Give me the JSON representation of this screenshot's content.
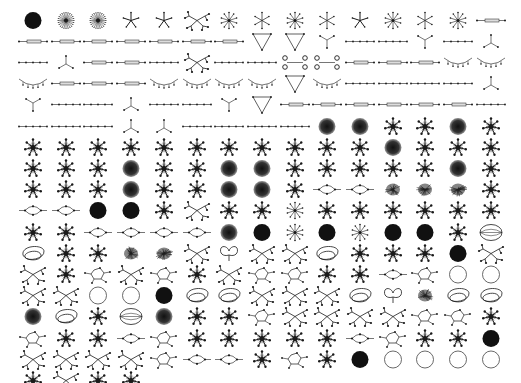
{
  "gallery": {
    "columns": 15,
    "origin_x": 33,
    "origin_y": 20,
    "col_step": 32.7,
    "row_step": 21.2,
    "ink_color": "#1a1a1a",
    "rows": [
      [
        "disc",
        "burst",
        "burst",
        "star5",
        "star5",
        "tree",
        "spokes",
        "star6",
        "spokes",
        "star6",
        "star5",
        "spokes",
        "star6",
        "spokes",
        "bar"
      ],
      [
        "bar",
        "bar",
        "bar",
        "bar",
        "bar",
        "bar",
        "bar",
        "triangle",
        "triangle",
        "ytri",
        "chain",
        "chain",
        "ytri",
        "chain",
        "tri"
      ],
      [
        "chain",
        "tri",
        "bar",
        "bar",
        "chain",
        "tree",
        "chain",
        "chain",
        "dumbbell",
        "dumbbell",
        "bar",
        "bar",
        "bar",
        "arc",
        "arc"
      ],
      [
        "arc",
        "bar",
        "bar",
        "bar",
        "arc",
        "arc",
        "arc",
        "arc",
        "triangle",
        "arc",
        "chain",
        "chain",
        "chain",
        "chain",
        "tri"
      ],
      [
        "ytri",
        "chain",
        "chain",
        "tri",
        "chain",
        "chain",
        "ytri",
        "triangle",
        "bar",
        "bar",
        "bar",
        "bar",
        "bar",
        "bar",
        "chain"
      ],
      [
        "chain",
        "chain",
        "chain",
        "tri",
        "tri",
        "chain",
        "chain",
        "chain",
        "chain",
        "gdisc",
        "gdisc",
        "spider",
        "spider",
        "gdisc",
        "spider"
      ],
      [
        "spider",
        "spider",
        "spider",
        "spider",
        "spider",
        "spider",
        "spider",
        "spider",
        "spider",
        "spider",
        "spider",
        "gdisc",
        "spider",
        "spider",
        "spider"
      ],
      [
        "spider",
        "spider",
        "spider",
        "gdisc",
        "spider",
        "spider",
        "gdisc",
        "gdisc",
        "spider",
        "spider",
        "spider",
        "spider",
        "spider",
        "gdisc",
        "spider"
      ],
      [
        "spider",
        "spider",
        "spider",
        "gdisc",
        "spider",
        "spider",
        "gdisc",
        "gdisc",
        "spider",
        "lens",
        "lens",
        "fuzz",
        "fuzz",
        "fuzz",
        "spider"
      ],
      [
        "lens",
        "lens",
        "disc",
        "disc",
        "spider",
        "tree",
        "spider",
        "spider",
        "spokes",
        "spider",
        "spider",
        "spider",
        "spider",
        "spider",
        "spider"
      ],
      [
        "spider",
        "spider",
        "lens",
        "lens",
        "lens",
        "lens",
        "gdisc",
        "disc",
        "spokes",
        "disc",
        "spokes",
        "disc",
        "disc",
        "spider",
        "eye"
      ],
      [
        "loop",
        "spider",
        "spider",
        "fuzz",
        "fuzz",
        "tree",
        "heart",
        "tree",
        "tree",
        "loop",
        "spider",
        "spider",
        "spider",
        "disc",
        "tree"
      ],
      [
        "tree",
        "spider",
        "cycle",
        "tree",
        "cycle",
        "spider",
        "tree",
        "cycle",
        "cycle",
        "spider",
        "spider",
        "lens",
        "cycle",
        "ring",
        "ring"
      ],
      [
        "tree",
        "tree",
        "ring",
        "ring",
        "disc",
        "loop",
        "loop",
        "tree",
        "tree",
        "tree",
        "loop",
        "heart",
        "fuzz",
        "loop",
        "loop"
      ],
      [
        "gdisc",
        "loop",
        "spider",
        "eye",
        "gdisc",
        "spider",
        "spider",
        "cycle",
        "tree",
        "tree",
        "tree",
        "tree",
        "cycle",
        "cycle",
        "spider"
      ],
      [
        "cycle",
        "spider",
        "spider",
        "lens",
        "cycle",
        "spider",
        "spider",
        "spider",
        "spider",
        "spider",
        "lens",
        "cycle",
        "spider",
        "spider",
        "disc"
      ],
      [
        "tree",
        "tree",
        "tree",
        "tree",
        "cycle",
        "lens",
        "lens",
        "spider",
        "cycle",
        "spider",
        "disc",
        "ring",
        "ring",
        "ring",
        "ring"
      ],
      [
        "spider",
        "tree",
        "spider",
        "spider"
      ]
    ]
  }
}
